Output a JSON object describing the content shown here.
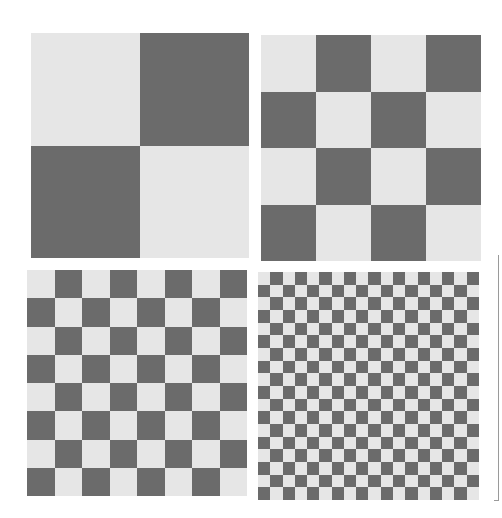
{
  "colors": {
    "light": "#e6e6e6",
    "dark": "#6b6b6b",
    "background": "#ffffff"
  },
  "panels": [
    {
      "id": "top-left",
      "grid": 2,
      "start": "light",
      "x": 31,
      "y": 33,
      "w": 218,
      "h": 225
    },
    {
      "id": "top-right",
      "grid": 4,
      "start": "light",
      "x": 261,
      "y": 35,
      "w": 220,
      "h": 226
    },
    {
      "id": "bottom-left",
      "grid": 8,
      "start": "light",
      "x": 27,
      "y": 270,
      "w": 220,
      "h": 226
    },
    {
      "id": "bottom-right",
      "grid": 18,
      "start": "light",
      "x": 258,
      "y": 272,
      "w": 221,
      "h": 228
    }
  ]
}
